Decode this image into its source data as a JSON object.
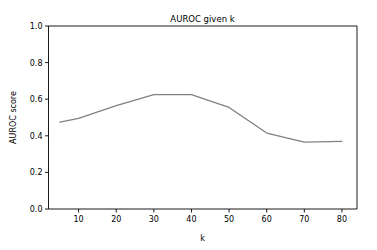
{
  "figure": {
    "background_color": "#ffffff",
    "axes_color": "#000000"
  },
  "chart_data": {
    "type": "line",
    "title": "AUROC given k",
    "xlabel": "k",
    "ylabel": "AUROC score",
    "xlim": [
      2.0,
      84.0
    ],
    "ylim": [
      0.0,
      1.0
    ],
    "grid": false,
    "legend": null,
    "line_color": "#808080",
    "x": [
      5,
      10,
      20,
      30,
      40,
      50,
      60,
      70,
      80
    ],
    "values": [
      0.475,
      0.495,
      0.565,
      0.625,
      0.625,
      0.555,
      0.415,
      0.365,
      0.37
    ],
    "series": [
      {
        "name": "AUROC",
        "x": [
          5,
          10,
          20,
          30,
          40,
          50,
          60,
          70,
          80
        ],
        "values": [
          0.475,
          0.495,
          0.565,
          0.625,
          0.625,
          0.555,
          0.415,
          0.365,
          0.37
        ]
      }
    ],
    "xticks": [
      10,
      20,
      30,
      40,
      50,
      60,
      70,
      80
    ],
    "xtick_labels": [
      "10",
      "20",
      "30",
      "40",
      "50",
      "60",
      "70",
      "80"
    ],
    "yticks": [
      0.0,
      0.2,
      0.4,
      0.6,
      0.8,
      1.0
    ],
    "ytick_labels": [
      "0.0",
      "0.2",
      "0.4",
      "0.6",
      "0.8",
      "1.0"
    ]
  }
}
